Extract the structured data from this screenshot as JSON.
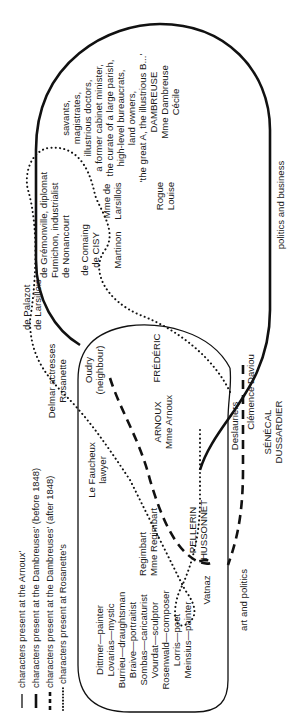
{
  "legend": [
    {
      "style": "solid-thin",
      "label": "characters present at the Arnoux'"
    },
    {
      "style": "solid-thick",
      "label": "characters present at the Dambreuses' (before 1848)"
    },
    {
      "style": "dashed",
      "label": "characters present at the Dambreuses' (after 1848)"
    },
    {
      "style": "dotted",
      "label": "characters present at Rosanette's"
    }
  ],
  "regions": {
    "politics_business": "politics and business",
    "art_politics": "art and politics"
  },
  "groups": {
    "dambreuse_circle": [
      "savants,",
      "magistrates,",
      "illustrious doctors,",
      "a former cabinet minister,",
      "the curate of a large parish,",
      "high-level bureaucrats,",
      "land owners,",
      "'the great A, the illustrious B...'"
    ],
    "dambreuse_family": [
      "DAMBREUSE",
      "Mme Dambreuse",
      "Cécile"
    ],
    "rogue": [
      "Rogue",
      "Louise"
    ],
    "gremonville": [
      "de Grémonville, diplomat",
      "Fumichon, industrialist",
      "de Nonancourt"
    ],
    "cisy": [
      "de Comaing",
      "de CISY"
    ],
    "larsillois": [
      "Mme de",
      "Larsillois"
    ],
    "martinon": [
      "Martinon"
    ],
    "palazot": [
      "de Palazot",
      "de Larsillois"
    ],
    "actresses": [
      "Delmar actresses",
      "Rosanette"
    ],
    "oudry": [
      "Oudry",
      "(neighbour)"
    ],
    "frederic": [
      "FRÉDÉRIC"
    ],
    "arnoux": [
      "ARNOUX",
      "Mme Arnoux"
    ],
    "fauchery": [
      "Le Faucheux",
      "lawyer"
    ],
    "regimbart": [
      "Regimbart",
      "Mme Regimbart"
    ],
    "pellerin": [
      "PELLERIN",
      "HUSSONNET"
    ],
    "artists": [
      "Dittmer—painter",
      "Lovarias—mystic",
      "Burrieu—draughtsman",
      "Braive—portraitist",
      "Sombas—caricaturist",
      "Vourdat—sculptor",
      "Rosenwald—composer",
      "Lorris—poet",
      "Meinsius—painter"
    ],
    "vatnaz": [
      "Vatnaz"
    ],
    "deslauriers": [
      "Deslauriers"
    ],
    "clemence": [
      "Clémence Daviou"
    ],
    "senecal": [
      "SÉNÉCAL",
      "DUSSARDIER"
    ]
  }
}
